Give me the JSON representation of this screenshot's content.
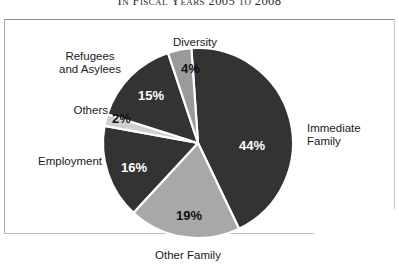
{
  "figure": {
    "title": "In Fiscal Years 2005 to 2008"
  },
  "chart_data": {
    "type": "pie",
    "title": "In Fiscal Years 2005 to 2008",
    "xlabel": "",
    "ylabel": "",
    "units": "percent",
    "total": 100,
    "legend_position": "outside-labels",
    "grid": false,
    "categories": [
      "Immediate Family",
      "Other Family",
      "Employment",
      "Others",
      "Refugees and Asylees",
      "Diversity"
    ],
    "values": [
      44,
      19,
      16,
      2,
      15,
      4
    ],
    "value_labels": [
      "44%",
      "19%",
      "16%",
      "2%",
      "15%",
      "4%"
    ],
    "colors": [
      "#333333",
      "#a8a8a8",
      "#333333",
      "#cfcfcf",
      "#333333",
      "#9a9a9a"
    ],
    "slices": [
      {
        "name": "Immediate Family",
        "label": "Immediate\nFamily",
        "value": 44,
        "value_label": "44%",
        "color": "#333333",
        "label_color": "#ffffff"
      },
      {
        "name": "Other Family",
        "label": "Other Family",
        "value": 19,
        "value_label": "19%",
        "color": "#a8a8a8",
        "label_color": "#111111"
      },
      {
        "name": "Employment",
        "label": "Employment",
        "value": 16,
        "value_label": "16%",
        "color": "#333333",
        "label_color": "#ffffff"
      },
      {
        "name": "Others",
        "label": "Others",
        "value": 2,
        "value_label": "2%",
        "color": "#cfcfcf",
        "label_color": "#111111"
      },
      {
        "name": "Refugees and Asylees",
        "label": "Refugees\nand Asylees",
        "value": 15,
        "value_label": "15%",
        "color": "#333333",
        "label_color": "#ffffff"
      },
      {
        "name": "Diversity",
        "label": "Diversity",
        "value": 4,
        "value_label": "4%",
        "color": "#9a9a9a",
        "label_color": "#111111"
      }
    ]
  },
  "geometry": {
    "center_x": 198,
    "center_y": 143,
    "radius": 95,
    "start_angle_deg": -4,
    "separator_color": "#ffffff",
    "separator_width": 2.2
  }
}
